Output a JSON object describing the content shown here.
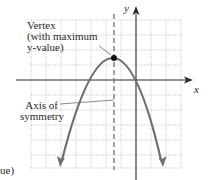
{
  "diagram": {
    "labels": {
      "vertex_line1": "Vertex",
      "vertex_line2": "(with maximum",
      "vertex_line3": "y-value)",
      "axis_line1": "Axis of",
      "axis_line2": "symmetry",
      "x_axis": "x",
      "y_axis": "y",
      "cutoff_text": "ue)"
    },
    "colors": {
      "curve": "#6e6e6e",
      "axes": "#2a2a2a",
      "grid": "#b5b5b5",
      "dashed_axis": "#7a7a7a",
      "vertex_point": "#111111",
      "text": "#2a2a2a"
    },
    "grid": {
      "columns": 10,
      "rows": 10
    },
    "parabola": {
      "opens": "down",
      "vertex_position": "left of y-axis, above x-axis",
      "passes_through_origin": true
    }
  }
}
